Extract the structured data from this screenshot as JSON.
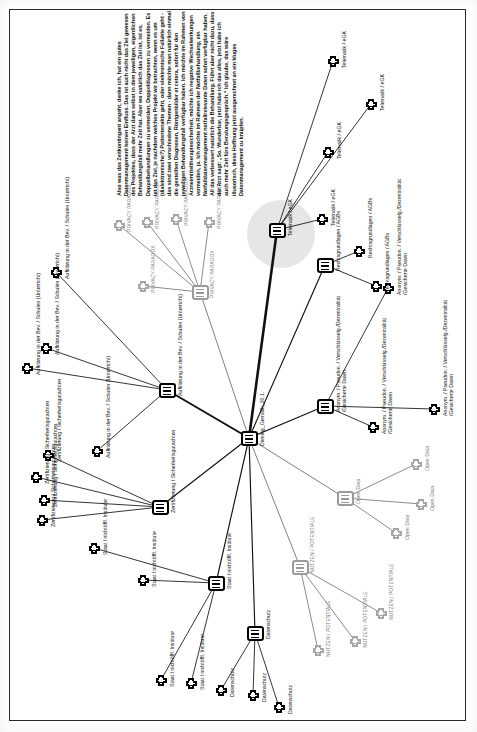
{
  "document": {
    "title": "Code-Netzwerk Diening_Gemalik_20.1.",
    "orientation": "rotated-90"
  },
  "quote": {
    "text": "Also was das Zeitkontingent angeht, denke ich, hat ein gutes Datenmanagement keinen Einfluss. Das ist auch nicht das Ziel gewesen des Projektes, dass der Arzt dann selbst in dem jeweiligen, eigentlichen Behandlungsfall mehr Zeit hat. Aber wo natürlich das Ziel ist, ist es, Doppelbehandlungen zu vermeiden, Doppeldiagnosen zu vermeiden. Es ist das Ziel, je nachdem welches Projekt wir betrachten, wenn es um (dialektronische?) Patientenakte geht, oder elektronische Fallakte geht - das sind zwei verschiedene Themen - dann möchte man natürlich einmal die gestellten Diagnosen, Röntgenbilder et cetera, sofort für den jeweiligen Behandlungsfall verfügbar haben. Ich möchte im Rahmen von Arzneimitteltherapiesicherheit, möchte ich negative Wechselwirkungen vermeiden, ja. Ich möchte im Rahmen der Notfallbehandlung, ein Notfalldatenmanagement notfallrelevante Daten sofort verfügbar haben. All das verbessert natürlich die Behandlung. Führt aber nicht dazu, dass der Arzt sagt: „So. Wunderbar, jetzt habe ich das alles, jetzt habe ich auch mehr Zeit fürs Beratungsgespräch.“ Ich glaube, das wäre illusorisch, diese Hoffnung jetzt ausgerechnet an ein kluges Datenmanagement zu knüpfen."
  },
  "colors": {
    "node_stroke_dark": "#000000",
    "node_stroke_gray": "#9a9a9a",
    "edge_dark": "#111111",
    "edge_gray": "#8a8a8a",
    "halo_fill": "#dcdcdc",
    "frame": "#2a2a2a",
    "paper": "#ffffff"
  },
  "center_node": {
    "id": "doc",
    "label": "Diening_Gemalik_20.1.",
    "kind": "document",
    "x": 249,
    "y": 438
  },
  "code_groups": [
    {
      "id": "telematik",
      "label": "Telematik / eGK",
      "kind": "code-group",
      "tone": "dark",
      "highlighted": true,
      "hub": {
        "x": 277,
        "y": 230
      },
      "halo": {
        "cx": 281,
        "cy": 234,
        "r": 34
      },
      "members": [
        {
          "label": "Telematik / eGK",
          "x": 328,
          "y": 152
        },
        {
          "label": "Telematik / eGK",
          "x": 371,
          "y": 104
        },
        {
          "label": "Telematik / eGK",
          "x": 333,
          "y": 61
        },
        {
          "label": "Telematik / eGK",
          "x": 322,
          "y": 219
        }
      ]
    },
    {
      "id": "privacy-paradox",
      "label": "PRIVACY PARADOX",
      "kind": "code-group",
      "tone": "gray",
      "highlighted": false,
      "hub": {
        "x": 200,
        "y": 292
      },
      "members": [
        {
          "label": "PRIVACY PARADOX",
          "x": 209,
          "y": 222
        },
        {
          "label": "PRIVACY PARADOX",
          "x": 176,
          "y": 219
        },
        {
          "label": "PRIVACY PARADOX",
          "x": 147,
          "y": 222
        },
        {
          "label": "PRIVACY PARADOX",
          "x": 119,
          "y": 225
        },
        {
          "label": "PRIVACY PARADOX",
          "x": 143,
          "y": 286
        }
      ]
    },
    {
      "id": "aufklaerung",
      "label": "Aufklärung in der Bev. / Schulen (Unterricht)",
      "kind": "code-group",
      "tone": "dark",
      "highlighted": false,
      "hub": {
        "x": 167,
        "y": 390
      },
      "members": [
        {
          "label": "Aufklärung in der Bev. / Schulen (Unterricht)",
          "x": 56,
          "y": 272
        },
        {
          "label": "Aufklärung in der Bev. / Schulen (Unterricht)",
          "x": 46,
          "y": 348
        },
        {
          "label": "Aufklärung in der Bev. / Schulen (Unterricht)",
          "x": 27,
          "y": 368
        },
        {
          "label": "Aufklärung in der Bev. / Schulen (Unterricht)",
          "x": 97,
          "y": 451
        }
      ]
    },
    {
      "id": "zertifizierung",
      "label": "Zertifizierung / Sicherheitsgutachten",
      "kind": "code-group",
      "tone": "dark",
      "highlighted": false,
      "hub": {
        "x": 160,
        "y": 507
      },
      "members": [
        {
          "label": "Zertifizierung / Sicherheitsgutachten",
          "x": 48,
          "y": 455
        },
        {
          "label": "Zertifizierung / Sicherheitsgutachten",
          "x": 36,
          "y": 477
        },
        {
          "label": "Zertifizierung / Sicherheitsgutachten",
          "x": 44,
          "y": 500
        },
        {
          "label": "Zertifizierung / Sicherheitsgutachten",
          "x": 42,
          "y": 520
        }
      ]
    },
    {
      "id": "staat",
      "label": "Staat / nichtöffl. Institute",
      "kind": "code-group",
      "tone": "dark",
      "highlighted": false,
      "hub": {
        "x": 216,
        "y": 583
      },
      "members": [
        {
          "label": "Staat / nichtöffl. Institute",
          "x": 94,
          "y": 548
        },
        {
          "label": "Staat / nichtöffl. Institute",
          "x": 143,
          "y": 580
        },
        {
          "label": "Staat / nichtöffl. Institute",
          "x": 161,
          "y": 680
        },
        {
          "label": "Staat / nichtöffl. Institute",
          "x": 191,
          "y": 683
        }
      ]
    },
    {
      "id": "datenschutz",
      "label": "Datenschutz",
      "kind": "code-group",
      "tone": "dark",
      "highlighted": false,
      "hub": {
        "x": 255,
        "y": 633
      },
      "members": [
        {
          "label": "Datenschutz",
          "x": 221,
          "y": 690
        },
        {
          "label": "Datenschutz",
          "x": 253,
          "y": 695
        },
        {
          "label": "Datenschutz",
          "x": 279,
          "y": 707
        }
      ]
    },
    {
      "id": "nutzen",
      "label": "NUTZEN / POTENTIALE",
      "kind": "code-group",
      "tone": "gray",
      "highlighted": false,
      "hub": {
        "x": 300,
        "y": 567
      },
      "members": [
        {
          "label": "NUTZEN / POTENTIALE",
          "x": 318,
          "y": 650
        },
        {
          "label": "NUTZEN / POTENTIALE",
          "x": 355,
          "y": 641
        },
        {
          "label": "NUTZEN / POTENTIALE",
          "x": 381,
          "y": 613
        }
      ]
    },
    {
      "id": "open-data",
      "label": "Open Data",
      "kind": "code-group",
      "tone": "gray",
      "highlighted": false,
      "hub": {
        "x": 345,
        "y": 498
      },
      "members": [
        {
          "label": "Open Data",
          "x": 416,
          "y": 464
        },
        {
          "label": "Open Data",
          "x": 421,
          "y": 504
        },
        {
          "label": "Open Data",
          "x": 396,
          "y": 533
        }
      ]
    },
    {
      "id": "anonym",
      "label": "Anonym. / Pseudon. / Verschlüsselg. /Dezentralität /Gesicherte Daten",
      "kind": "code-group",
      "tone": "dark",
      "highlighted": false,
      "hub": {
        "x": 325,
        "y": 406
      },
      "members": [
        {
          "label": "Anonym. / Pseudon. / Verschlüsselg./Dezentralität /Gesicherte Daten",
          "x": 373,
          "y": 427
        },
        {
          "label": "Anonym. / Pseudon. / Verschlüsselg./Dezentralität /Gesicherte Daten",
          "x": 434,
          "y": 409
        },
        {
          "label": "Anonym. / Pseudon. / Verschlüsselg./Dezentralität /Gesicherte Daten",
          "x": 388,
          "y": 288
        }
      ]
    },
    {
      "id": "rechtsgrundlagen",
      "label": "Rechtsgrundlagen / AGBs",
      "kind": "code-group",
      "tone": "dark",
      "highlighted": false,
      "hub": {
        "x": 325,
        "y": 265
      },
      "members": [
        {
          "label": "Rechtsgrundlagen / AGBs",
          "x": 376,
          "y": 286
        },
        {
          "label": "Rechtsgrundlagen / AGBs",
          "x": 359,
          "y": 251
        }
      ]
    }
  ],
  "labels": {
    "telematik": "Telematik / eGK",
    "privacy_paradox": "PRIVACY PARADOX",
    "aufklaerung": "Aufklärung in der Bev. / Schulen (Unterricht)",
    "zertifizierung": "Zertifizierung / Sicherheitsgutachten",
    "staat": "Staat / nichtöffl. Institute",
    "datenschutz": "Datenschutz",
    "nutzen": "NUTZEN / POTENTIALE",
    "open_data": "Open Data",
    "anonym_l1": "Anonym. / Pseudon. / Verschlüsselg./Dezentralität",
    "anonym_l2": "/Gesicherte Daten",
    "rechtsgrundlagen": "Rechtsgrundlagen / AGBs",
    "center": "Diening_Gemalik_20.1."
  }
}
